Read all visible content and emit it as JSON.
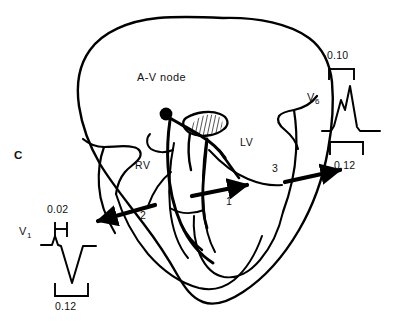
{
  "figure": {
    "panel_label": "C",
    "node_label": "A-V node",
    "chambers": {
      "right_ventricle": "RV",
      "left_ventricle": "LV"
    },
    "vectors": [
      {
        "id": "1",
        "label": "1",
        "direction": "rightward",
        "target": "septum-to-left-ventricle"
      },
      {
        "id": "2",
        "label": "2",
        "direction": "left-downward",
        "target": "V1"
      },
      {
        "id": "3",
        "label": "3",
        "direction": "right-upward",
        "target": "V6"
      }
    ],
    "block_region": "hatched-conduction-block",
    "colors": {
      "ink": "#000000",
      "background": "#ffffff",
      "hatch": "#2b2b2b"
    }
  },
  "tracings": [
    {
      "lead": "V",
      "lead_subscript": "1",
      "upper_interval": "0.02",
      "lower_interval": "0.12",
      "morphology": "small-r-deep-wide-S"
    },
    {
      "lead": "V",
      "lead_subscript": "6",
      "upper_interval": "0.10",
      "lower_interval": "0.12",
      "morphology": "notched-M-shaped-RsR"
    }
  ]
}
